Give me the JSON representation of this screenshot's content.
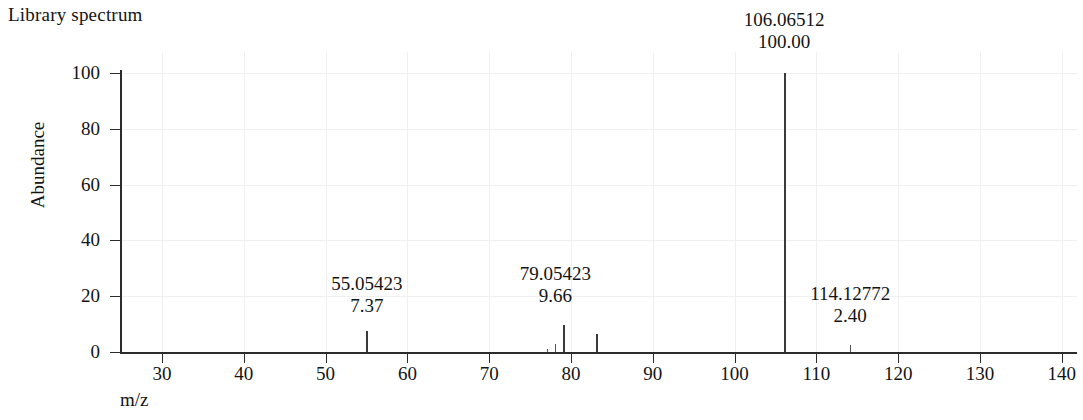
{
  "header": {
    "title": "Library spectrum"
  },
  "axes": {
    "y_title": "Abundance",
    "x_title": "m/z",
    "y_ticks": [
      "0",
      "20",
      "40",
      "60",
      "80",
      "100"
    ],
    "x_ticks": [
      "30",
      "40",
      "50",
      "60",
      "70",
      "80",
      "90",
      "100",
      "110",
      "120",
      "130",
      "140"
    ]
  },
  "annotations": [
    {
      "id": "ann-55",
      "mz": "55.05423",
      "abundance": "7.37"
    },
    {
      "id": "ann-79",
      "mz": "79.05423",
      "abundance": "9.66"
    },
    {
      "id": "ann-106",
      "mz": "106.06512",
      "abundance": "100.00"
    },
    {
      "id": "ann-114",
      "mz": "114.12772",
      "abundance": "2.40"
    }
  ],
  "colors": {
    "peak": "#3a3a3a",
    "axis": "#2b2b2b",
    "grid": "#f0f0f2",
    "text": "#141414",
    "background": "#ffffff"
  },
  "chart_data": {
    "type": "bar",
    "title": "Library spectrum",
    "xlabel": "m/z",
    "ylabel": "Abundance",
    "xlim": [
      25,
      145
    ],
    "ylim": [
      0,
      105
    ],
    "grid": true,
    "legend": "none",
    "x": [
      55.05423,
      77.03858,
      78.04641,
      79.05423,
      83.08553,
      106.06512,
      114.12772
    ],
    "values": [
      7.37,
      1.1,
      2.9,
      9.66,
      6.4,
      100.0,
      2.4
    ],
    "labeled_peaks": [
      {
        "mz": 55.05423,
        "abundance": 7.37
      },
      {
        "mz": 79.05423,
        "abundance": 9.66
      },
      {
        "mz": 106.06512,
        "abundance": 100.0
      },
      {
        "mz": 114.12772,
        "abundance": 2.4
      }
    ]
  }
}
